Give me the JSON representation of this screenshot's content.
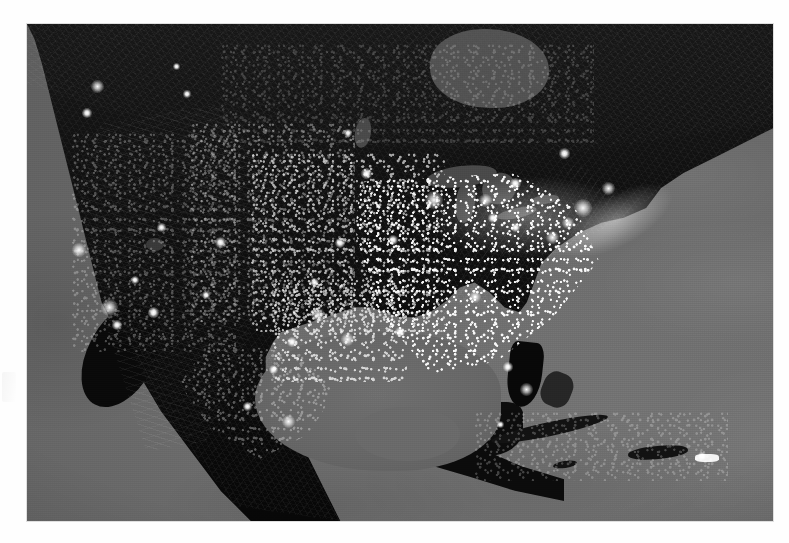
{
  "document": {
    "type": "satellite-photograph",
    "title": "Earth at Night — North America",
    "caption": "",
    "medium": "grayscale night-lights composite",
    "page_background": "#fefefe"
  },
  "photo": {
    "alt_text": "Grayscale night-time satellite composite of North America showing city lights against dark land and gray ocean",
    "frame": {
      "left_px": 27,
      "top_px": 24,
      "width_px": 746,
      "height_px": 497
    },
    "palette": {
      "ocean": "#6a6a6a",
      "land_dark": "#121212",
      "lights": "#ffffff",
      "lakes": "#4b4b4b",
      "margin": "#fefefe"
    }
  },
  "map_features": {
    "water_bodies": [
      {
        "name": "Pacific Ocean",
        "id": "pacific-ocean"
      },
      {
        "name": "Atlantic Ocean",
        "id": "atlantic-ocean"
      },
      {
        "name": "Gulf of Mexico",
        "id": "gulf-of-mexico"
      },
      {
        "name": "Caribbean Sea",
        "id": "caribbean-sea"
      },
      {
        "name": "Hudson Bay",
        "id": "hudson-bay"
      },
      {
        "name": "Lake Superior",
        "id": "lake-superior"
      },
      {
        "name": "Lake Michigan",
        "id": "lake-michigan"
      },
      {
        "name": "Lake Huron",
        "id": "lake-huron"
      },
      {
        "name": "Lake Erie",
        "id": "lake-erie"
      },
      {
        "name": "Lake Ontario",
        "id": "lake-ontario"
      },
      {
        "name": "Lake Winnipeg",
        "id": "lake-winnipeg"
      },
      {
        "name": "Great Salt Lake",
        "id": "great-salt-lake"
      }
    ],
    "landmasses": [
      {
        "name": "North American mainland",
        "id": "north-america"
      },
      {
        "name": "Baja California",
        "id": "baja-california"
      },
      {
        "name": "Yucatan Peninsula",
        "id": "yucatan-peninsula"
      },
      {
        "name": "Central America",
        "id": "central-america"
      },
      {
        "name": "Florida Peninsula",
        "id": "florida-peninsula"
      },
      {
        "name": "Cuba",
        "id": "cuba"
      },
      {
        "name": "Bahamas",
        "id": "bahamas"
      },
      {
        "name": "Hispaniola",
        "id": "hispaniola"
      },
      {
        "name": "Jamaica",
        "id": "jamaica"
      },
      {
        "name": "Puerto Rico",
        "id": "puerto-rico"
      }
    ],
    "light_regions": [
      {
        "name": "Northeast Corridor",
        "id": "northeast-corridor",
        "intensity": "very-high"
      },
      {
        "name": "Great Lakes / Chicago",
        "id": "great-lakes-lights",
        "intensity": "very-high"
      },
      {
        "name": "Eastern United States",
        "id": "eastern-us-lights",
        "intensity": "high"
      },
      {
        "name": "Midwest",
        "id": "midwest-lights",
        "intensity": "medium"
      },
      {
        "name": "Great Plains",
        "id": "plains-lights",
        "intensity": "low"
      },
      {
        "name": "Texas and Gulf Coast",
        "id": "texas-gulf-lights",
        "intensity": "medium-high"
      },
      {
        "name": "Western United States",
        "id": "western-us-lights",
        "intensity": "low"
      },
      {
        "name": "Canada",
        "id": "canada-lights",
        "intensity": "very-low"
      },
      {
        "name": "Mexico",
        "id": "mexico-lights",
        "intensity": "low-medium"
      },
      {
        "name": "Caribbean",
        "id": "caribbean-lights",
        "intensity": "very-low"
      }
    ],
    "bright_cities": [
      {
        "name": "Seattle",
        "id": "seattle",
        "x_pct": 9.5,
        "y_pct": 12.5,
        "size_px": 13
      },
      {
        "name": "Portland",
        "id": "portland",
        "x_pct": 8.0,
        "y_pct": 18.0,
        "size_px": 10
      },
      {
        "name": "San Francisco Bay Area",
        "id": "san-francisco",
        "x_pct": 7.0,
        "y_pct": 45.5,
        "size_px": 14
      },
      {
        "name": "Los Angeles",
        "id": "los-angeles",
        "x_pct": 11.0,
        "y_pct": 57.0,
        "size_px": 17
      },
      {
        "name": "San Diego",
        "id": "san-diego",
        "x_pct": 12.0,
        "y_pct": 60.5,
        "size_px": 10
      },
      {
        "name": "Las Vegas",
        "id": "las-vegas",
        "x_pct": 14.5,
        "y_pct": 51.5,
        "size_px": 8
      },
      {
        "name": "Phoenix",
        "id": "phoenix",
        "x_pct": 17.0,
        "y_pct": 58.0,
        "size_px": 11
      },
      {
        "name": "Salt Lake City",
        "id": "salt-lake-city",
        "x_pct": 18.0,
        "y_pct": 41.0,
        "size_px": 9
      },
      {
        "name": "Denver",
        "id": "denver",
        "x_pct": 26.0,
        "y_pct": 44.0,
        "size_px": 11
      },
      {
        "name": "Albuquerque",
        "id": "albuquerque",
        "x_pct": 24.0,
        "y_pct": 54.5,
        "size_px": 8
      },
      {
        "name": "Calgary",
        "id": "calgary",
        "x_pct": 21.5,
        "y_pct": 14.0,
        "size_px": 8
      },
      {
        "name": "Edmonton",
        "id": "edmonton",
        "x_pct": 20.0,
        "y_pct": 8.5,
        "size_px": 7
      },
      {
        "name": "Winnipeg",
        "id": "winnipeg",
        "x_pct": 43.0,
        "y_pct": 22.0,
        "size_px": 8
      },
      {
        "name": "Minneapolis",
        "id": "minneapolis",
        "x_pct": 45.5,
        "y_pct": 30.0,
        "size_px": 11
      },
      {
        "name": "Kansas City",
        "id": "kansas-city",
        "x_pct": 42.0,
        "y_pct": 44.0,
        "size_px": 10
      },
      {
        "name": "Oklahoma City",
        "id": "oklahoma-city",
        "x_pct": 38.5,
        "y_pct": 52.0,
        "size_px": 9
      },
      {
        "name": "Dallas-Fort Worth",
        "id": "dallas",
        "x_pct": 39.0,
        "y_pct": 58.5,
        "size_px": 14
      },
      {
        "name": "San Antonio",
        "id": "san-antonio",
        "x_pct": 35.5,
        "y_pct": 64.0,
        "size_px": 10
      },
      {
        "name": "Houston",
        "id": "houston",
        "x_pct": 43.0,
        "y_pct": 63.5,
        "size_px": 13
      },
      {
        "name": "New Orleans",
        "id": "new-orleans",
        "x_pct": 50.0,
        "y_pct": 62.0,
        "size_px": 10
      },
      {
        "name": "St. Louis",
        "id": "st-louis",
        "x_pct": 49.0,
        "y_pct": 43.5,
        "size_px": 10
      },
      {
        "name": "Chicago",
        "id": "chicago",
        "x_pct": 54.5,
        "y_pct": 35.5,
        "size_px": 18
      },
      {
        "name": "Detroit",
        "id": "detroit",
        "x_pct": 61.5,
        "y_pct": 35.5,
        "size_px": 13
      },
      {
        "name": "Toronto",
        "id": "toronto",
        "x_pct": 65.5,
        "y_pct": 32.0,
        "size_px": 11
      },
      {
        "name": "Montreal",
        "id": "montreal",
        "x_pct": 72.0,
        "y_pct": 26.0,
        "size_px": 11
      },
      {
        "name": "Cleveland",
        "id": "cleveland",
        "x_pct": 62.5,
        "y_pct": 39.0,
        "size_px": 10
      },
      {
        "name": "Pittsburgh",
        "id": "pittsburgh",
        "x_pct": 65.5,
        "y_pct": 41.0,
        "size_px": 9
      },
      {
        "name": "Atlanta",
        "id": "atlanta",
        "x_pct": 60.0,
        "y_pct": 55.0,
        "size_px": 12
      },
      {
        "name": "Miami",
        "id": "miami",
        "x_pct": 67.0,
        "y_pct": 73.5,
        "size_px": 13
      },
      {
        "name": "Tampa",
        "id": "tampa",
        "x_pct": 64.5,
        "y_pct": 69.0,
        "size_px": 10
      },
      {
        "name": "Washington DC",
        "id": "washington-dc",
        "x_pct": 70.5,
        "y_pct": 43.0,
        "size_px": 13
      },
      {
        "name": "Philadelphia",
        "id": "philadelphia",
        "x_pct": 72.5,
        "y_pct": 40.0,
        "size_px": 12
      },
      {
        "name": "New York City",
        "id": "new-york",
        "x_pct": 74.5,
        "y_pct": 37.0,
        "size_px": 18
      },
      {
        "name": "Boston",
        "id": "boston",
        "x_pct": 78.0,
        "y_pct": 33.0,
        "size_px": 13
      },
      {
        "name": "Mexico City",
        "id": "mexico-city",
        "x_pct": 35.0,
        "y_pct": 80.0,
        "size_px": 13
      },
      {
        "name": "Guadalajara",
        "id": "guadalajara",
        "x_pct": 29.5,
        "y_pct": 77.0,
        "size_px": 9
      },
      {
        "name": "Monterrey",
        "id": "monterrey",
        "x_pct": 33.0,
        "y_pct": 69.5,
        "size_px": 9
      },
      {
        "name": "Havana",
        "id": "havana",
        "x_pct": 63.5,
        "y_pct": 80.5,
        "size_px": 7
      },
      {
        "name": "San Juan",
        "id": "san-juan",
        "x_pct": 90.5,
        "y_pct": 87.0,
        "size_px": 8
      }
    ]
  }
}
